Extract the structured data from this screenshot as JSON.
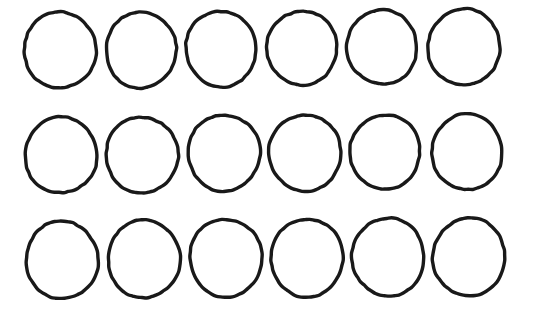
{
  "canvas": {
    "width": 533,
    "height": 321,
    "background_color": "#ffffff",
    "title": "Circle Grid"
  },
  "style": {
    "stroke_color": "#191919",
    "stroke_width": 3.4,
    "fill": "none",
    "shape_kind": "circle-outline",
    "rendering": "hand-drawn"
  },
  "grid": {
    "rows": 3,
    "columns": 6,
    "total_shapes": 18,
    "column_pitch": 81,
    "row_pitch": 105,
    "column_centers": [
      60,
      141,
      222,
      302,
      383,
      464
    ],
    "row_centers": [
      50,
      155,
      259
    ],
    "radius_x": 36,
    "radius_y": 38
  },
  "shapes": [
    {
      "id": "circle-r1-c1",
      "row": 1,
      "col": 1,
      "cx": 60,
      "cy": 50,
      "rx": 36,
      "ry": 38,
      "rotate": -3
    },
    {
      "id": "circle-r1-c2",
      "row": 1,
      "col": 2,
      "cx": 141,
      "cy": 50,
      "rx": 35,
      "ry": 38,
      "rotate": 4
    },
    {
      "id": "circle-r1-c3",
      "row": 1,
      "col": 3,
      "cx": 221,
      "cy": 49,
      "rx": 35,
      "ry": 38,
      "rotate": -6
    },
    {
      "id": "circle-r1-c4",
      "row": 1,
      "col": 4,
      "cx": 302,
      "cy": 48,
      "rx": 35,
      "ry": 37,
      "rotate": 2
    },
    {
      "id": "circle-r1-c5",
      "row": 1,
      "col": 5,
      "cx": 382,
      "cy": 47,
      "rx": 35,
      "ry": 37,
      "rotate": -4
    },
    {
      "id": "circle-r1-c6",
      "row": 1,
      "col": 6,
      "cx": 464,
      "cy": 47,
      "rx": 36,
      "ry": 38,
      "rotate": 5
    },
    {
      "id": "circle-r2-c1",
      "row": 2,
      "col": 1,
      "cx": 61,
      "cy": 155,
      "rx": 36,
      "ry": 38,
      "rotate": 3
    },
    {
      "id": "circle-r2-c2",
      "row": 2,
      "col": 2,
      "cx": 142,
      "cy": 155,
      "rx": 36,
      "ry": 38,
      "rotate": -5
    },
    {
      "id": "circle-r2-c3",
      "row": 2,
      "col": 3,
      "cx": 224,
      "cy": 153,
      "rx": 36,
      "ry": 38,
      "rotate": 2
    },
    {
      "id": "circle-r2-c4",
      "row": 2,
      "col": 4,
      "cx": 305,
      "cy": 153,
      "rx": 36,
      "ry": 38,
      "rotate": -3
    },
    {
      "id": "circle-r2-c5",
      "row": 2,
      "col": 5,
      "cx": 385,
      "cy": 152,
      "rx": 35,
      "ry": 37,
      "rotate": 6
    },
    {
      "id": "circle-r2-c6",
      "row": 2,
      "col": 6,
      "cx": 467,
      "cy": 152,
      "rx": 35,
      "ry": 38,
      "rotate": -2
    },
    {
      "id": "circle-r3-c1",
      "row": 3,
      "col": 1,
      "cx": 62,
      "cy": 260,
      "rx": 36,
      "ry": 39,
      "rotate": -4
    },
    {
      "id": "circle-r3-c2",
      "row": 3,
      "col": 2,
      "cx": 144,
      "cy": 259,
      "rx": 36,
      "ry": 39,
      "rotate": 3
    },
    {
      "id": "circle-r3-c3",
      "row": 3,
      "col": 3,
      "cx": 226,
      "cy": 258,
      "rx": 36,
      "ry": 39,
      "rotate": -6
    },
    {
      "id": "circle-r3-c4",
      "row": 3,
      "col": 4,
      "cx": 307,
      "cy": 258,
      "rx": 36,
      "ry": 39,
      "rotate": 4
    },
    {
      "id": "circle-r3-c5",
      "row": 3,
      "col": 5,
      "cx": 388,
      "cy": 257,
      "rx": 36,
      "ry": 39,
      "rotate": -2
    },
    {
      "id": "circle-r3-c6",
      "row": 3,
      "col": 6,
      "cx": 469,
      "cy": 257,
      "rx": 36,
      "ry": 39,
      "rotate": 5
    }
  ]
}
